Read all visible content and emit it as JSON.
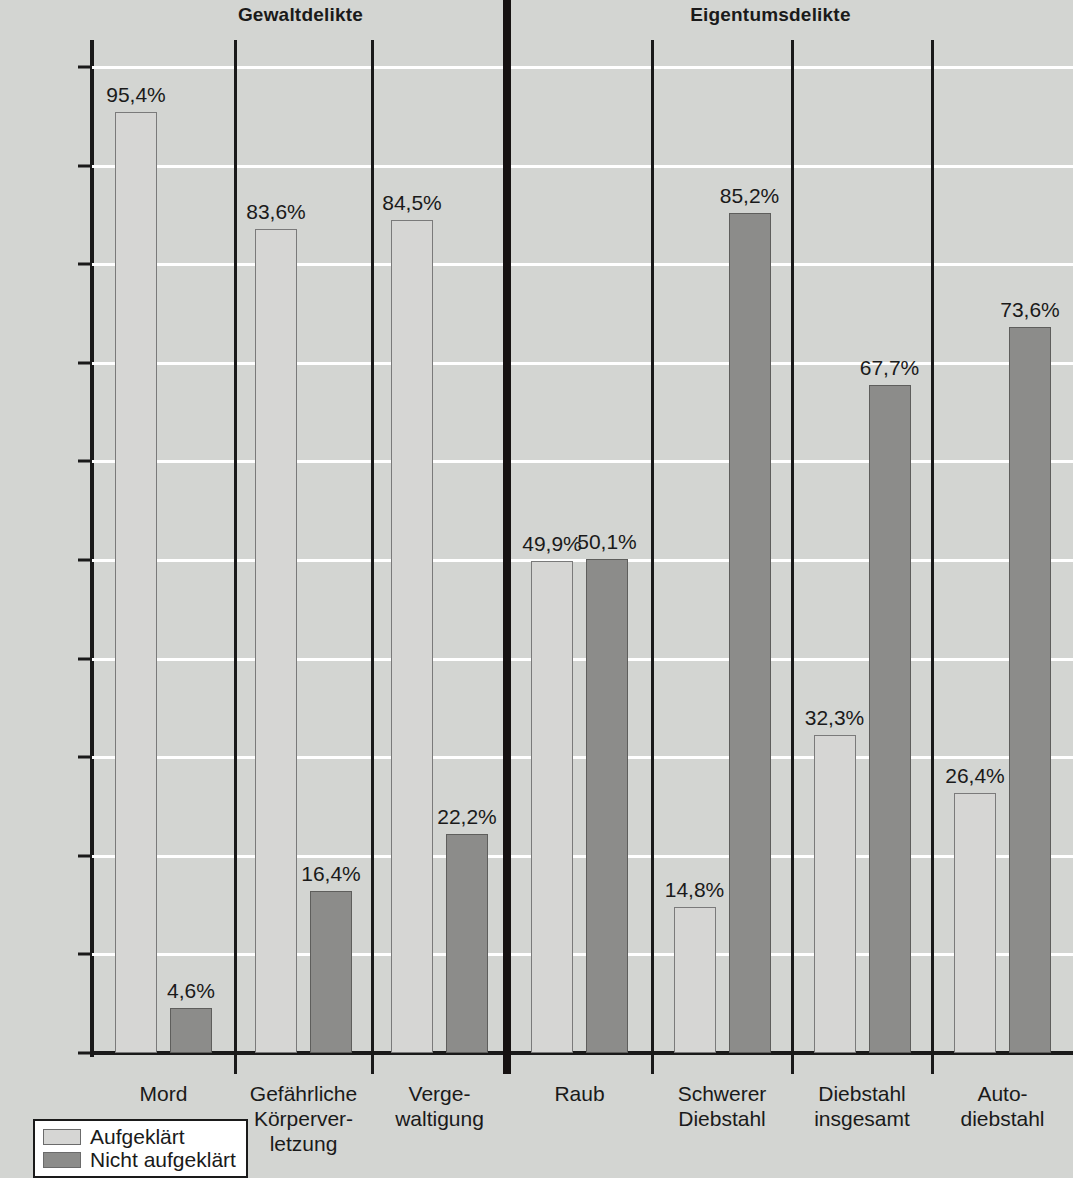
{
  "chart_data": {
    "type": "bar",
    "title": "",
    "xlabel": "",
    "ylabel": "",
    "ylim": [
      0,
      100
    ],
    "grid": true,
    "legend_position": "bottom-left",
    "value_suffix": "%",
    "decimal_separator": ",",
    "group_headers": [
      {
        "label": "Gewaltdelikte",
        "center_pct": 28.0
      },
      {
        "label": "Eigentumsdelikte",
        "center_pct": 71.8
      }
    ],
    "ytick_labels": [
      "100%",
      "90%",
      "80%",
      "70%",
      "60%",
      "50%",
      "40%",
      "30%",
      "20%",
      "10%",
      "0%"
    ],
    "ytick_values": [
      100,
      90,
      80,
      70,
      60,
      50,
      40,
      30,
      20,
      10,
      0
    ],
    "categories": [
      "Mord",
      "Gefährliche\nKörperver-\nletzung",
      "Verge-\nwaltigung",
      "Raub",
      "Schwerer\nDiebstahl",
      "Diebstahl\ninsgesamt",
      "Auto-\ndiebstahl"
    ],
    "series": [
      {
        "name": "Aufgeklärt",
        "color": "#d6d6d4",
        "values": [
          95.4,
          83.6,
          84.5,
          49.9,
          14.8,
          32.3,
          26.4
        ],
        "labels": [
          "95,4%",
          "83,6%",
          "84,5%",
          "49,9%",
          "14,8%",
          "32,3%",
          "26,4%"
        ]
      },
      {
        "name": "Nicht aufgeklärt",
        "color": "#8c8c8a",
        "values": [
          4.6,
          16.4,
          22.2,
          50.1,
          85.2,
          67.7,
          73.6
        ],
        "labels": [
          "4,6%",
          "16,4%",
          "22,2%",
          "50,1%",
          "85,2%",
          "67,7%",
          "73,6%"
        ]
      }
    ],
    "major_divider_after_category_index": 2
  },
  "legend": {
    "items": [
      {
        "label": "Aufgeklärt",
        "swatch": "light"
      },
      {
        "label": "Nicht aufgeklärt",
        "swatch": "dark"
      }
    ]
  },
  "colors": {
    "background": "#d3d5d2",
    "light_bar": "#d6d6d4",
    "dark_bar": "#8c8c8a",
    "axis": "#1a1a1a",
    "gridline": "#ffffff"
  }
}
